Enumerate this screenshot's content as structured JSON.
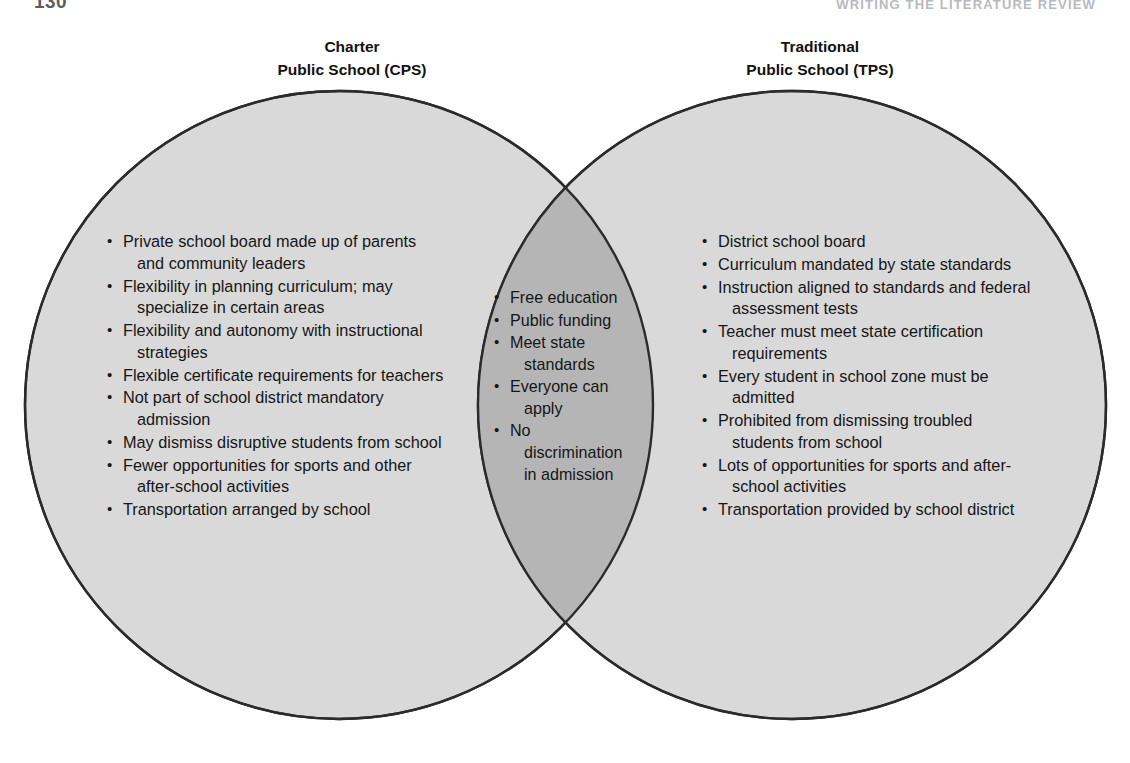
{
  "page": {
    "folio": "130",
    "running_head": "WRITING THE LITERATURE REVIEW"
  },
  "colors": {
    "circle_fill": "#d9d9d9",
    "intersection_fill": "#b5b5b5",
    "circle_stroke": "#2b2b2b",
    "text": "#161616",
    "background": "#ffffff"
  },
  "diagram": {
    "type": "venn",
    "sets": 2,
    "left": {
      "title_line_1": "Charter",
      "title_line_2": "Public School (CPS)",
      "items": [
        "Private school board made up of parents and community leaders",
        "Flexibility in planning curriculum; may specialize in certain areas",
        "Flexibility and autonomy with instructional strategies",
        "Flexible certificate requirements for teachers",
        "Not part of school district mandatory admission",
        "May dismiss disruptive students from school",
        "Fewer opportunities for sports and other after-school activities",
        "Transportation arranged by school"
      ]
    },
    "intersection": {
      "items": [
        "Free education",
        "Public funding",
        "Meet state standards",
        "Everyone can apply",
        "No discrimination in admission"
      ]
    },
    "right": {
      "title_line_1": "Traditional",
      "title_line_2": "Public School (TPS)",
      "items": [
        "District school board",
        "Curriculum mandated by state standards",
        "Instruction aligned to standards and federal assessment tests",
        "Teacher must meet state certification requirements",
        "Every student in school zone must be admitted",
        "Prohibited from dismissing troubled students from school",
        "Lots of opportunities for sports and after-school activities",
        "Transportation provided by school district"
      ]
    }
  }
}
